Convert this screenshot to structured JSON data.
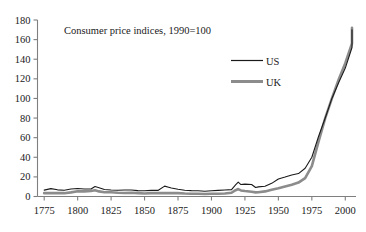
{
  "chart_data": {
    "type": "line",
    "title": "Consumer price indices, 1990=100",
    "xlabel": "",
    "ylabel": "",
    "xlim": [
      1770,
      2008
    ],
    "ylim": [
      0,
      180
    ],
    "ytick_step": 20,
    "xtick_step": 25,
    "grid": false,
    "legend_position": "upper-center-right",
    "yticks": [
      "0",
      "20",
      "40",
      "60",
      "80",
      "100",
      "120",
      "140",
      "160",
      "180"
    ],
    "xticks": [
      "1775",
      "1800",
      "1825",
      "1850",
      "1875",
      "1900",
      "1925",
      "1950",
      "1975",
      "2000"
    ],
    "series": [
      {
        "name": "US",
        "color": "#1a1a1a",
        "style": "thin-black-line",
        "x": [
          1775,
          1780,
          1785,
          1790,
          1795,
          1800,
          1805,
          1810,
          1813,
          1816,
          1820,
          1825,
          1830,
          1835,
          1840,
          1845,
          1850,
          1855,
          1860,
          1865,
          1868,
          1870,
          1875,
          1880,
          1885,
          1890,
          1895,
          1900,
          1905,
          1910,
          1915,
          1918,
          1920,
          1922,
          1925,
          1930,
          1933,
          1935,
          1940,
          1945,
          1950,
          1955,
          1960,
          1965,
          1970,
          1975,
          1980,
          1985,
          1990,
          1995,
          2000,
          2005
        ],
        "y": [
          6.5,
          8.0,
          6.8,
          6.4,
          7.6,
          8.2,
          7.6,
          7.6,
          10.2,
          9.0,
          7.2,
          6.6,
          6.4,
          6.6,
          6.6,
          6.0,
          5.8,
          6.2,
          6.2,
          10.6,
          9.4,
          8.6,
          7.4,
          6.4,
          6.0,
          5.8,
          5.4,
          5.8,
          6.2,
          6.6,
          7.0,
          11.8,
          14.6,
          12.2,
          12.6,
          12.2,
          9.2,
          9.8,
          10.4,
          13.4,
          17.8,
          19.8,
          22.0,
          23.4,
          28.8,
          40.0,
          61.2,
          80.0,
          100.0,
          116.0,
          131.0,
          152.0
        ],
        "end_value": 170
      },
      {
        "name": "UK",
        "color": "#8c8c8c",
        "style": "thick-gray-line",
        "x": [
          1775,
          1780,
          1785,
          1790,
          1795,
          1800,
          1805,
          1810,
          1813,
          1816,
          1820,
          1825,
          1830,
          1835,
          1840,
          1845,
          1850,
          1855,
          1860,
          1865,
          1870,
          1875,
          1880,
          1885,
          1890,
          1895,
          1900,
          1905,
          1910,
          1915,
          1918,
          1920,
          1922,
          1925,
          1930,
          1933,
          1935,
          1940,
          1945,
          1950,
          1955,
          1960,
          1965,
          1970,
          1975,
          1980,
          1985,
          1990,
          1995,
          2000,
          2005
        ],
        "y": [
          3.4,
          3.6,
          3.4,
          3.4,
          4.2,
          5.4,
          5.2,
          5.6,
          6.4,
          5.2,
          4.4,
          4.4,
          3.8,
          3.6,
          3.8,
          3.4,
          3.0,
          3.4,
          3.4,
          3.4,
          3.4,
          3.4,
          3.0,
          2.8,
          2.8,
          2.6,
          2.8,
          2.8,
          3.0,
          3.8,
          6.4,
          7.6,
          6.2,
          5.6,
          4.8,
          4.2,
          4.4,
          5.2,
          6.8,
          8.4,
          10.2,
          12.0,
          14.2,
          18.8,
          31.0,
          56.0,
          80.0,
          100.0,
          119.0,
          136.0,
          156.0
        ],
        "end_value": 172
      }
    ],
    "annotations": []
  },
  "legend": {
    "items": [
      {
        "label": "US"
      },
      {
        "label": "UK"
      }
    ]
  },
  "colors": {
    "us": "#1a1a1a",
    "uk": "#8c8c8c",
    "axis": "#7f7f7f",
    "text": "#1a1a1a",
    "background": "#ffffff"
  }
}
